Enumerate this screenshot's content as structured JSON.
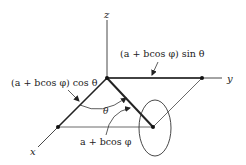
{
  "diagram": {
    "type": "torus-parametrization-geometry",
    "axes": {
      "x_label": "x",
      "y_label": "y",
      "z_label": "z"
    },
    "labels": {
      "y_component": "(a + bcos φ) sin θ",
      "x_component": "(a + bcos φ) cos θ",
      "radius": "a + bcos φ",
      "angle": "θ"
    },
    "colors": {
      "line": "#222222",
      "background": "#ffffff"
    }
  }
}
